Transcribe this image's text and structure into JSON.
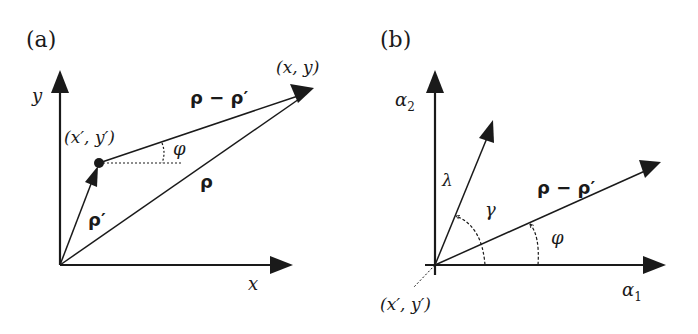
{
  "panels": [
    {
      "id": "a",
      "label": "(a)",
      "axes": {
        "x": "x",
        "y": "y"
      },
      "points": {
        "source": "(x′, y′)",
        "target": "(x, y)"
      },
      "vectors": {
        "rho": "ρ",
        "rho_prime": "ρ′",
        "rho_diff": "ρ − ρ′"
      },
      "angle": "φ"
    },
    {
      "id": "b",
      "label": "(b)",
      "axes": {
        "x": "α",
        "x_sub": "1",
        "y": "α",
        "y_sub": "2"
      },
      "points": {
        "origin": "(x′, y′)"
      },
      "vectors": {
        "lambda": "λ",
        "rho_diff": "ρ − ρ′"
      },
      "angles": {
        "gamma": "γ",
        "phi": "φ"
      }
    }
  ],
  "colors": {
    "ink": "#1a1a1a",
    "background": "#ffffff"
  }
}
